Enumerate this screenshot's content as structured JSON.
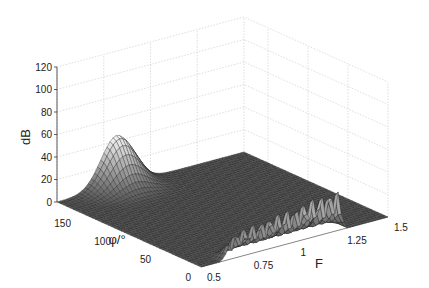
{
  "chart_data": {
    "type": "surface3d",
    "title": "",
    "xlabel": "F",
    "ylabel": "φ/°",
    "zlabel": "dB",
    "xlim": [
      0.5,
      1.5
    ],
    "ylim": [
      0,
      180
    ],
    "zlim": [
      0,
      120
    ],
    "xticks": [
      "0.5",
      "0.75",
      "1",
      "1.25",
      "1.5"
    ],
    "yticks": [
      "0",
      "50",
      "100",
      "150"
    ],
    "zticks": [
      "0",
      "20",
      "40",
      "60",
      "80",
      "100",
      "120"
    ],
    "grid": true,
    "colormap": "gray",
    "features": [
      {
        "name": "peak near phi=180",
        "F_range": [
          0.5,
          1.0
        ],
        "phi": 180,
        "max_dB": 45
      },
      {
        "name": "ridge near phi=0",
        "F_range": [
          0.6,
          1.25
        ],
        "phi": 0,
        "max_dB": 45,
        "oscillating": true
      }
    ],
    "baseline_dB": 0
  },
  "labels": {
    "x": "F",
    "y": "φ/°",
    "z": "dB"
  }
}
